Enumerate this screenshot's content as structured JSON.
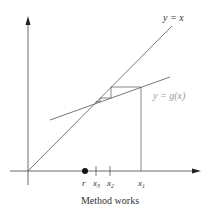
{
  "figure": {
    "caption": "Method works",
    "curves": {
      "identity_label": "y = x",
      "g_label": "y = g(x)"
    },
    "axis_labels": {
      "r": "r",
      "x3": "x",
      "x3_sub": "3",
      "x2": "x",
      "x2_sub": "2",
      "x1": "x",
      "x1_sub": "1"
    },
    "colors": {
      "line": "#555555",
      "axis": "#333333",
      "g_label": "#9a9a9a",
      "text": "#333333"
    }
  }
}
